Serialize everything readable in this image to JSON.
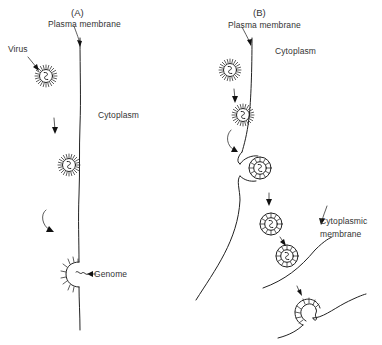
{
  "figure": {
    "type": "biological schematic line drawing",
    "panels": [
      {
        "id": "A",
        "label": "(A)",
        "caption_labels": {
          "plasma_membrane": "Plasma membrane",
          "virus": "Virus",
          "cytoplasm": "Cytoplasm",
          "genome": "Genome"
        },
        "steps": [
          "virus approaches membrane",
          "virus attaches to plasma membrane",
          "envelope fuses, genome released into cytoplasm"
        ]
      },
      {
        "id": "B",
        "label": "(B)",
        "caption_labels": {
          "plasma_membrane": "Plasma membrane",
          "cytoplasm": "Cytoplasm",
          "cytoplasmic_membrane": "Cytoplasmic membrane"
        },
        "steps": [
          "virus approaches membrane",
          "virus attaches",
          "membrane invaginates",
          "virus in coated vesicle",
          "vesicle moves to cytoplasmic membrane",
          "fusion and genome release"
        ]
      }
    ],
    "colors": {
      "line": "#222222",
      "text": "#333333",
      "background": "#ffffff"
    }
  }
}
